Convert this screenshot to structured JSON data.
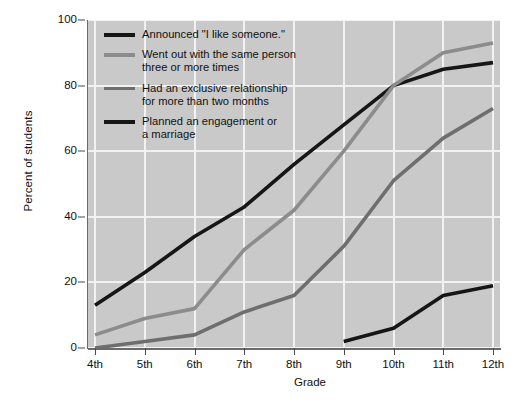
{
  "chart_data": {
    "type": "line",
    "title": "",
    "xlabel": "Grade",
    "ylabel": "Percent of students",
    "categories": [
      "4th",
      "5th",
      "6th",
      "7th",
      "8th",
      "9th",
      "10th",
      "11th",
      "12th"
    ],
    "xlim": [
      0,
      8
    ],
    "ylim": [
      0,
      100
    ],
    "yticks": [
      0,
      20,
      40,
      60,
      80,
      100
    ],
    "grid": true,
    "legend_position": "upper-left-inside",
    "series": [
      {
        "name": "Announced \"I like someone.\"",
        "color": "#161616",
        "x": [
          "4th",
          "5th",
          "6th",
          "7th",
          "8th",
          "9th",
          "10th",
          "11th",
          "12th"
        ],
        "values": [
          13,
          23,
          34,
          43,
          56,
          68,
          80,
          85,
          87
        ]
      },
      {
        "name": "Went out with the same person\nthree or more times",
        "color": "#8c8c8c",
        "x": [
          "4th",
          "5th",
          "6th",
          "7th",
          "8th",
          "9th",
          "10th",
          "11th",
          "12th"
        ],
        "values": [
          4,
          9,
          12,
          30,
          42,
          60,
          80,
          90,
          93
        ]
      },
      {
        "name": "Had an exclusive relationship\nfor more than two months",
        "color": "#6e6e6e",
        "x": [
          "4th",
          "5th",
          "6th",
          "7th",
          "8th",
          "9th",
          "10th",
          "11th",
          "12th"
        ],
        "values": [
          0,
          2,
          4,
          11,
          16,
          31,
          51,
          64,
          73
        ]
      },
      {
        "name": "Planned an engagement or\na marriage",
        "color": "#161616",
        "x": [
          "9th",
          "10th",
          "11th",
          "12th"
        ],
        "values": [
          2,
          6,
          16,
          19
        ]
      }
    ]
  },
  "axes": {
    "y_title": "Percent of students",
    "x_title": "Grade",
    "y_tick_labels": [
      "0",
      "20",
      "40",
      "60",
      "80",
      "100"
    ],
    "x_tick_labels": [
      "4th",
      "5th",
      "6th",
      "7th",
      "8th",
      "9th",
      "10th",
      "11th",
      "12th"
    ]
  },
  "legend": {
    "items": [
      {
        "label": "Announced \"I like someone.\"",
        "color": "#161616"
      },
      {
        "label": "Went out with the same person\nthree or more times",
        "color": "#8c8c8c"
      },
      {
        "label": "Had an exclusive relationship\nfor more than two months",
        "color": "#6e6e6e"
      },
      {
        "label": "Planned an engagement or\na marriage",
        "color": "#161616"
      }
    ]
  },
  "colors": {
    "plot_background": "#c9c9c9",
    "gridline": "#f2f2f2",
    "axis": "#6b6b6b",
    "page_background": "#ffffff",
    "text": "#111111"
  }
}
